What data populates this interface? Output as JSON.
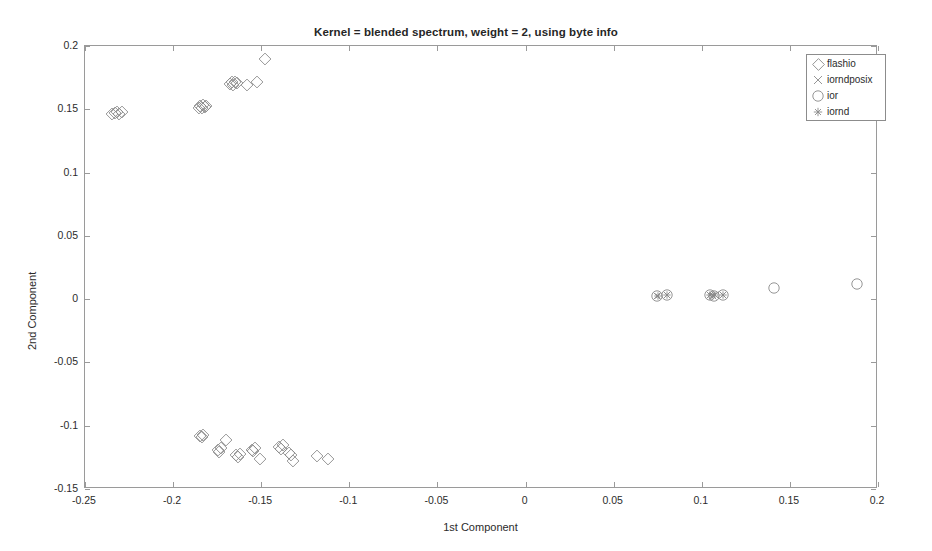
{
  "chart_data": {
    "type": "scatter",
    "title": "Kernel = blended spectrum, weight = 2, using byte info",
    "xlabel": "1st Component",
    "ylabel": "2nd Component",
    "xlim": [
      -0.25,
      0.2
    ],
    "ylim": [
      -0.15,
      0.2
    ],
    "xticks": [
      -0.25,
      -0.2,
      -0.15,
      -0.1,
      -0.05,
      0,
      0.05,
      0.1,
      0.15,
      0.2
    ],
    "xtick_labels": [
      "-0.25",
      "-0.2",
      "-0.15",
      "-0.1",
      "-0.05",
      "0",
      "0.05",
      "0.1",
      "0.15",
      "0.2"
    ],
    "yticks": [
      -0.15,
      -0.1,
      -0.05,
      0,
      0.05,
      0.1,
      0.15,
      0.2
    ],
    "ytick_labels": [
      "-0.15",
      "-0.1",
      "-0.05",
      "0",
      "0.05",
      "0.1",
      "0.15",
      "0.2"
    ],
    "grid": false,
    "legend_position": "top-right",
    "marker_color": "#8a8a8a",
    "series": [
      {
        "name": "flashio",
        "marker": "diamond",
        "points": [
          [
            -0.2345,
            0.1465
          ],
          [
            -0.233,
            0.147
          ],
          [
            -0.2318,
            0.1478
          ],
          [
            -0.2305,
            0.1462
          ],
          [
            -0.2292,
            0.148
          ],
          [
            -0.1855,
            0.1512
          ],
          [
            -0.1845,
            0.1525
          ],
          [
            -0.1838,
            0.151
          ],
          [
            -0.1828,
            0.1535
          ],
          [
            -0.182,
            0.1518
          ],
          [
            -0.1812,
            0.1528
          ],
          [
            -0.168,
            0.17
          ],
          [
            -0.1668,
            0.1712
          ],
          [
            -0.1658,
            0.1695
          ],
          [
            -0.1648,
            0.1718
          ],
          [
            -0.1638,
            0.1705
          ],
          [
            -0.1578,
            0.1688
          ],
          [
            -0.1522,
            0.1718
          ],
          [
            -0.1478,
            0.19
          ],
          [
            -0.1848,
            -0.1082
          ],
          [
            -0.1838,
            -0.1092
          ],
          [
            -0.1828,
            -0.1075
          ],
          [
            -0.1745,
            -0.1188
          ],
          [
            -0.1738,
            -0.1205
          ],
          [
            -0.1728,
            -0.1178
          ],
          [
            -0.17,
            -0.1112
          ],
          [
            -0.1642,
            -0.1232
          ],
          [
            -0.1632,
            -0.1245
          ],
          [
            -0.1622,
            -0.1222
          ],
          [
            -0.1555,
            -0.1188
          ],
          [
            -0.1545,
            -0.1202
          ],
          [
            -0.1535,
            -0.1175
          ],
          [
            -0.1508,
            -0.1262
          ],
          [
            -0.1398,
            -0.1168
          ],
          [
            -0.1388,
            -0.1182
          ],
          [
            -0.1378,
            -0.1155
          ],
          [
            -0.134,
            -0.1212
          ],
          [
            -0.1332,
            -0.1228
          ],
          [
            -0.1318,
            -0.1275
          ],
          [
            -0.1182,
            -0.1242
          ],
          [
            -0.1122,
            -0.1262
          ]
        ]
      },
      {
        "name": "iorndposix",
        "marker": "cross",
        "points": [
          [
            0.0745,
            0.0028
          ],
          [
            0.08,
            0.003
          ],
          [
            0.1048,
            0.0032
          ],
          [
            0.1062,
            0.0028
          ],
          [
            0.1075,
            0.0035
          ],
          [
            0.112,
            0.003
          ]
        ]
      },
      {
        "name": "ior",
        "marker": "circle",
        "points": [
          [
            0.0745,
            0.0028
          ],
          [
            0.08,
            0.003
          ],
          [
            0.1048,
            0.0032
          ],
          [
            0.1068,
            0.0028
          ],
          [
            0.1122,
            0.0032
          ],
          [
            0.1412,
            0.009
          ],
          [
            0.1882,
            0.0122
          ]
        ]
      },
      {
        "name": "iornd",
        "marker": "asterisk",
        "points": [
          [
            0.0752,
            0.0028
          ],
          [
            0.0805,
            0.003
          ],
          [
            0.1045,
            0.0032
          ],
          [
            0.1065,
            0.003
          ],
          [
            0.1118,
            0.0032
          ]
        ]
      }
    ]
  },
  "legend": {
    "entries": [
      {
        "label": "flashio",
        "marker": "diamond"
      },
      {
        "label": "iorndposix",
        "marker": "cross"
      },
      {
        "label": "ior",
        "marker": "circle"
      },
      {
        "label": "iornd",
        "marker": "asterisk"
      }
    ]
  }
}
